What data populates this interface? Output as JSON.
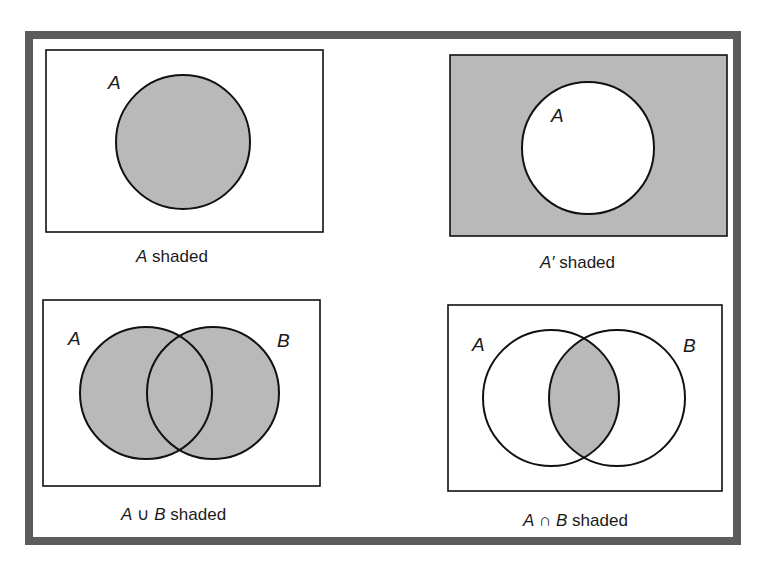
{
  "figure": {
    "frame_color": "#5c5c5c",
    "shade_color": "#b9b9b9",
    "line_color": "#111111"
  },
  "panels": [
    {
      "id": "a-shaded",
      "set_labels": [
        "A"
      ],
      "caption": {
        "expr": "A",
        "suffix": " shaded"
      },
      "shaded_region": "A"
    },
    {
      "id": "a-complement-shaded",
      "set_labels": [
        "A"
      ],
      "caption": {
        "expr": "A′",
        "suffix": " shaded"
      },
      "shaded_region": "complement of A"
    },
    {
      "id": "a-union-b-shaded",
      "set_labels": [
        "A",
        "B"
      ],
      "caption": {
        "expr_a": "A",
        "op": "∪",
        "expr_b": "B",
        "suffix": " shaded"
      },
      "shaded_region": "A union B"
    },
    {
      "id": "a-intersect-b-shaded",
      "set_labels": [
        "A",
        "B"
      ],
      "caption": {
        "expr_a": "A",
        "op": "∩",
        "expr_b": "B",
        "suffix": " shaded"
      },
      "shaded_region": "A intersection B"
    }
  ]
}
